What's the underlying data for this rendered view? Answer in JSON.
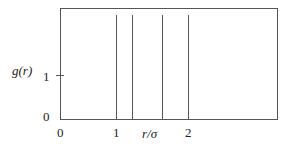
{
  "chart_data": {
    "type": "line",
    "title": "",
    "xlabel": "r/σ",
    "ylabel": "g(r)",
    "x_ticks": [
      {
        "value": 0,
        "label": "0"
      },
      {
        "value": 1,
        "label": "1"
      },
      {
        "value": 2,
        "label": "2"
      }
    ],
    "y_ticks": [
      {
        "value": 0,
        "label": "0"
      },
      {
        "value": 1,
        "label": "1"
      }
    ],
    "series": [
      {
        "name": "g(r) delta peaks",
        "style": "vertical lines",
        "x": [
          1.0,
          1.225,
          1.633,
          2.0
        ]
      }
    ],
    "grid": false,
    "legend": null
  },
  "colors": {
    "axis": "#555555",
    "lines": "#555555",
    "text": "#222222"
  }
}
